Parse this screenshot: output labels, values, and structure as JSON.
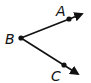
{
  "diagram": {
    "vertex": {
      "label": "B"
    },
    "rays": [
      {
        "name": "ray-BA",
        "point_label": "A"
      },
      {
        "name": "ray-BC",
        "point_label": "C"
      }
    ],
    "colors": {
      "ink": "#111111",
      "background": "#ffffff"
    }
  }
}
